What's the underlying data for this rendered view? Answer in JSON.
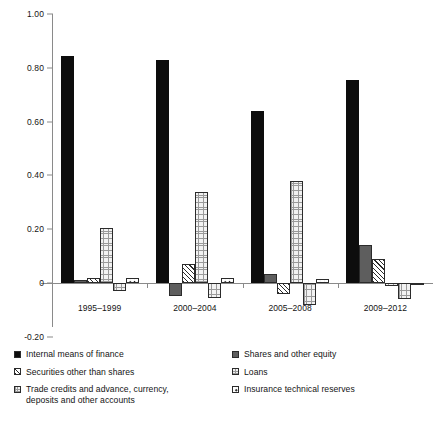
{
  "chart_data": {
    "type": "bar",
    "title": "",
    "subtitle": "",
    "xlabel": "",
    "ylabel": "",
    "ylim": [
      -0.2,
      1.0
    ],
    "yticks": [
      "1.00",
      "0.80",
      "0.60",
      "0.40",
      "0.20",
      "0",
      "-0.20"
    ],
    "ytick_values": [
      1.0,
      0.8,
      0.6,
      0.4,
      0.2,
      0,
      -0.2
    ],
    "grid": false,
    "legend_position": "bottom",
    "categories": [
      "1995–1999",
      "2000–2004",
      "2005–2008",
      "2009–2012"
    ],
    "series": [
      {
        "name": "Internal means of finance",
        "pattern": "solid-black",
        "color": "#0d0d0d",
        "values": [
          0.845,
          0.83,
          0.64,
          0.755
        ]
      },
      {
        "name": "Shares and other equity",
        "pattern": "solid-gray",
        "color": "#5e5e5e",
        "values": [
          0.012,
          -0.05,
          0.035,
          0.14
        ]
      },
      {
        "name": "Securities other than shares",
        "pattern": "diagonal-hatch",
        "color": "#ffffff",
        "values": [
          0.018,
          0.07,
          -0.04,
          0.09
        ]
      },
      {
        "name": "Loans",
        "pattern": "fine-grid",
        "color": "#f2f2f2",
        "values": [
          0.205,
          0.34,
          0.38,
          -0.012
        ]
      },
      {
        "name": "Trade credits and advance, currency, deposits and other accounts",
        "pattern": "fine-grid",
        "color": "#f2f2f2",
        "values": [
          -0.03,
          -0.055,
          -0.08,
          -0.06
        ]
      },
      {
        "name": "Insurance technical reserves",
        "pattern": "dot-box",
        "color": "#ffffff",
        "values": [
          0.018,
          0.02,
          0.015,
          -0.008
        ]
      }
    ]
  },
  "legend": {
    "left_column": [
      {
        "label": "Internal means of finance",
        "swatch": "solid-black-swatch"
      },
      {
        "label": "Securities other than shares",
        "swatch": "diagonal-hatch-swatch"
      },
      {
        "label": "Trade credits and advance, currency,\ndeposits and other accounts",
        "swatch": "fine-grid-swatch"
      }
    ],
    "right_column": [
      {
        "label": "Shares and other equity",
        "swatch": "solid-gray-swatch"
      },
      {
        "label": "Loans",
        "swatch": "light-outline-swatch"
      },
      {
        "label": "Insurance technical reserves",
        "swatch": "dot-box-swatch"
      }
    ]
  }
}
